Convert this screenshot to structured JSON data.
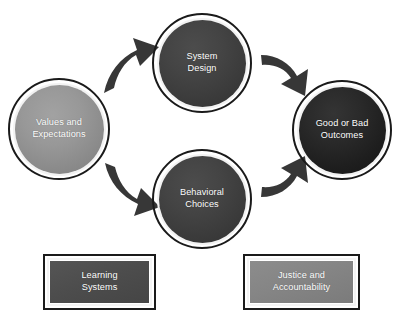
{
  "diagram": {
    "background_color": "#ffffff",
    "nodes": [
      {
        "id": "values",
        "label": "Values and\nExpectations",
        "line1": "Values and",
        "line2": "Expectations",
        "shape": "circle",
        "fill_color": "#8f8f8f",
        "text_color": "#ffffff"
      },
      {
        "id": "system_design",
        "label": "System\nDesign",
        "line1": "System",
        "line2": "Design",
        "shape": "circle",
        "fill_color": "#414141",
        "text_color": "#ffffff"
      },
      {
        "id": "behavioral_choices",
        "label": "Behavioral\nChoices",
        "line1": "Behavioral",
        "line2": "Choices",
        "shape": "circle",
        "fill_color": "#414141",
        "text_color": "#ffffff"
      },
      {
        "id": "outcomes",
        "label": "Good or Bad\nOutcomes",
        "line1": "Good or Bad",
        "line2": "Outcomes",
        "shape": "circle",
        "fill_color": "#242424",
        "text_color": "#ffffff"
      },
      {
        "id": "learning_systems",
        "label": "Learning\nSystems",
        "line1": "Learning",
        "line2": "Systems",
        "shape": "rectangle",
        "fill_color": "#4d4d4d",
        "text_color": "#ffffff"
      },
      {
        "id": "justice_accountability",
        "label": "Justice and\nAccountability",
        "line1": "Justice and",
        "line2": "Accountability",
        "shape": "rectangle",
        "fill_color": "#858585",
        "text_color": "#ffffff"
      }
    ],
    "arrows": [
      {
        "id": "values-to-system-design",
        "from": "values",
        "to": "system_design",
        "direction": "up-right",
        "color": "#373737"
      },
      {
        "id": "system-design-to-outcomes",
        "from": "system_design",
        "to": "outcomes",
        "direction": "down-right",
        "color": "#373737"
      },
      {
        "id": "values-to-behavioral-choices",
        "from": "values",
        "to": "behavioral_choices",
        "direction": "down-right",
        "color": "#373737"
      },
      {
        "id": "behavioral-choices-to-outcomes",
        "from": "behavioral_choices",
        "to": "outcomes",
        "direction": "up-right",
        "color": "#373737"
      }
    ]
  }
}
